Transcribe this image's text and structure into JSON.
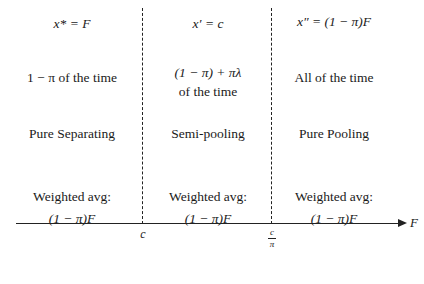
{
  "columns": [
    {
      "equation": "x* = F",
      "frequency": [
        "1 − π of the time"
      ],
      "regime": "Pure Separating",
      "weighted_label": "Weighted avg:",
      "weighted_value": "(1 − π)F"
    },
    {
      "equation": "x′ = c",
      "frequency": [
        "(1 − π) + πλ",
        "of the time"
      ],
      "regime": "Semi-pooling",
      "weighted_label": "Weighted avg:",
      "weighted_value": "(1 − π)F"
    },
    {
      "equation": "x″ = (1 − π)F",
      "frequency": [
        "All of the time"
      ],
      "regime": "Pure Pooling",
      "weighted_label": "Weighted avg:",
      "weighted_value": "(1 − π)F"
    }
  ],
  "axis": {
    "label": "F",
    "ticks": [
      {
        "label": "c"
      },
      {
        "numerator": "c",
        "denominator": "π"
      }
    ]
  }
}
